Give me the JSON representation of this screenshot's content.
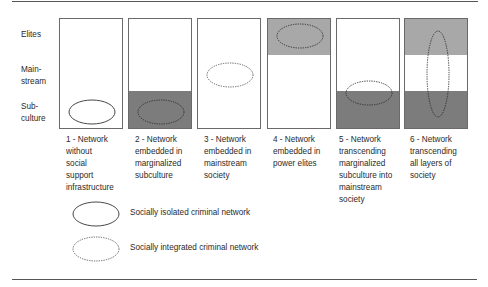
{
  "figure": {
    "row_labels": [
      {
        "id": "elites",
        "lines": [
          "Elites"
        ]
      },
      {
        "id": "mainstream",
        "lines": [
          "Main-",
          "stream"
        ]
      },
      {
        "id": "subculture",
        "lines": [
          "Sub-",
          "culture"
        ]
      }
    ],
    "panels": [
      {
        "id": 1,
        "caption": [
          "1 - Network",
          "without",
          "social",
          "support",
          "infrastructure"
        ],
        "shaded_elites": false,
        "shaded_subculture": false,
        "ellipse": "solid",
        "ellipse_position": "subculture"
      },
      {
        "id": 2,
        "caption": [
          "2 - Network",
          "embedded in",
          "marginalized",
          "subculture"
        ],
        "shaded_elites": false,
        "shaded_subculture": true,
        "ellipse": "dotted",
        "ellipse_position": "subculture"
      },
      {
        "id": 3,
        "caption": [
          "3 - Network",
          "embedded in",
          "mainstream",
          "society"
        ],
        "shaded_elites": false,
        "shaded_subculture": false,
        "ellipse": "dotted",
        "ellipse_position": "mainstream"
      },
      {
        "id": 4,
        "caption": [
          "4 - Network",
          "embedded in",
          "power elites"
        ],
        "shaded_elites": true,
        "shaded_subculture": false,
        "ellipse": "dotted",
        "ellipse_position": "elites"
      },
      {
        "id": 5,
        "caption": [
          "5 - Network",
          "transcending",
          "marginalized",
          "subculture into",
          "mainstream",
          "society"
        ],
        "shaded_elites": false,
        "shaded_subculture": true,
        "ellipse": "dotted",
        "ellipse_position": "subculture-mainstream"
      },
      {
        "id": 6,
        "caption": [
          "6 - Network",
          "transcending",
          "all layers of",
          "society"
        ],
        "shaded_elites": true,
        "shaded_subculture": true,
        "ellipse": "dotted",
        "ellipse_position": "all-layers"
      }
    ],
    "legend": [
      {
        "style": "solid",
        "label": "Socially isolated criminal network"
      },
      {
        "style": "dotted",
        "label": "Socially integrated criminal network"
      }
    ],
    "colors": {
      "elite_shade": "#a8a8a8",
      "subculture_shade": "#7c7c7c",
      "border": "#6a6a6a",
      "ellipse_stroke": "#333333"
    }
  }
}
